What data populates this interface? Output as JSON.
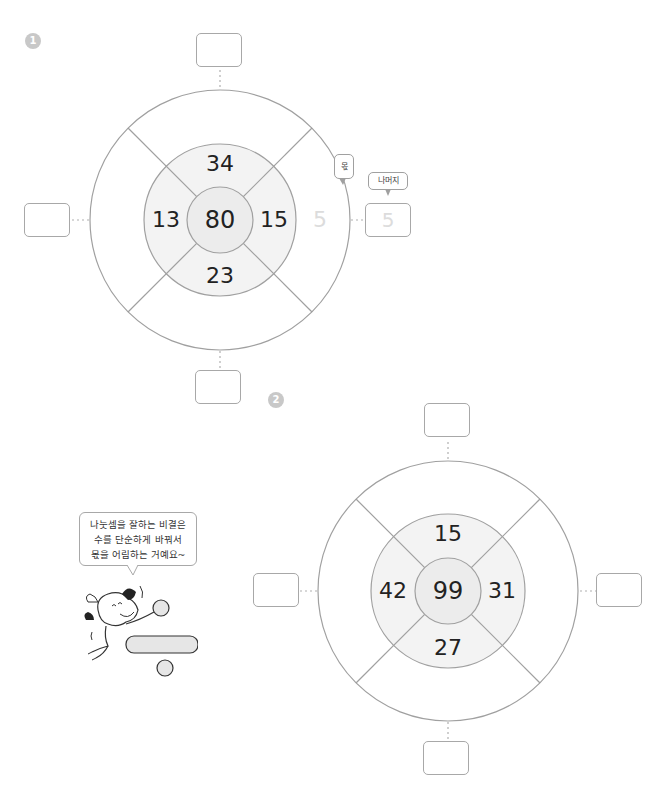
{
  "problems": [
    {
      "number": "1",
      "center": 80,
      "top": 34,
      "left": 13,
      "right": 15,
      "bottom": 23,
      "example_quotient": "5",
      "example_remainder": "5",
      "labels": {
        "quotient": "몫",
        "remainder": "나머지"
      },
      "answers": {
        "top": "",
        "left": "",
        "right": "5",
        "bottom": ""
      }
    },
    {
      "number": "2",
      "center": 99,
      "top": 15,
      "left": 42,
      "right": 31,
      "bottom": 27,
      "answers": {
        "top": "",
        "left": "",
        "right": "",
        "bottom": ""
      }
    }
  ],
  "tip": {
    "lines": [
      "나눗셈을 잘하는 비결은",
      "수를 단순하게 바꿔서",
      "몫을 어림하는 거예요~"
    ]
  },
  "illustration": {
    "subject": "cartoon dog holding division sign",
    "colors": {
      "fill": "#e6e6e6",
      "stroke": "#333333"
    }
  },
  "colors": {
    "stroke": "#a0a0a0",
    "middle_ring": "#f3f3f3",
    "inner_circle": "#ececec",
    "faded_text": "#dcdcdc",
    "badge": "#c8c8c8"
  }
}
